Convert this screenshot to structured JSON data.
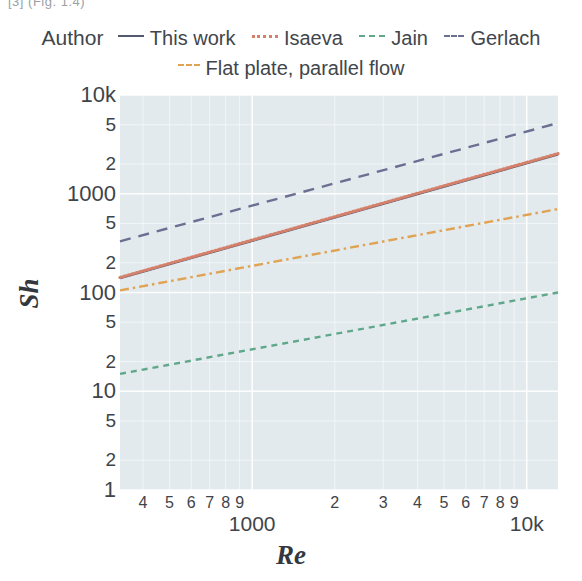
{
  "top_fragment": "[3] (Fig. 1.4)",
  "legend": {
    "title": "Author",
    "row1": [
      {
        "label": "This work",
        "style": "solid",
        "color": "#53586e"
      },
      {
        "label": "Isaeva",
        "style": "dotted",
        "color": "#d4806a"
      },
      {
        "label": "Jain",
        "style": "dashed-sm",
        "color": "#5fa88a"
      },
      {
        "label": "Gerlach",
        "style": "dashed-lg",
        "color": "#6b6f91"
      }
    ],
    "row2": [
      {
        "label": "Flat plate, parallel flow",
        "style": "dashdot",
        "color": "#e0a253"
      }
    ]
  },
  "chart_data": {
    "type": "line",
    "title": "",
    "xlabel": "Re",
    "ylabel": "Sh",
    "xscale": "log",
    "yscale": "log",
    "xlim": [
      330,
      13000
    ],
    "ylim": [
      1,
      10000
    ],
    "grid": true,
    "plot_bg": "#e3eaee",
    "legend_position": "top",
    "x_ticks_minor": [
      400,
      500,
      600,
      700,
      800,
      900,
      2000,
      3000,
      4000,
      5000,
      6000,
      7000,
      8000,
      9000
    ],
    "x_tick_labels_minor": [
      "4",
      "5",
      "6",
      "7",
      "8",
      "9",
      "2",
      "3",
      "4",
      "5",
      "6",
      "7",
      "8",
      "9"
    ],
    "x_ticks_major": [
      1000,
      10000
    ],
    "x_tick_labels_major": [
      "1000",
      "10k"
    ],
    "y_ticks": [
      1,
      2,
      5,
      10,
      20,
      50,
      100,
      200,
      500,
      1000,
      2000,
      5000,
      10000
    ],
    "y_tick_labels": [
      "1",
      "2",
      "5",
      "10",
      "5",
      "2",
      "100",
      "5",
      "2",
      "1000",
      "2",
      "5",
      "10k"
    ],
    "y_tick_labels_ordered_top_down": [
      "10k",
      "5",
      "2",
      "1000",
      "5",
      "2",
      "100",
      "5",
      "2",
      "10",
      "5",
      "2",
      "1"
    ],
    "series": [
      {
        "name": "This work",
        "style": "solid",
        "color": "#53586e",
        "points": [
          [
            330,
            140
          ],
          [
            13000,
            2500
          ]
        ],
        "slope_exponent": 0.785
      },
      {
        "name": "Isaeva",
        "style": "dotted",
        "color": "#d4806a",
        "points": [
          [
            330,
            142
          ],
          [
            13000,
            2550
          ]
        ],
        "slope_exponent": 0.785
      },
      {
        "name": "Jain",
        "style": "dashed",
        "color": "#5fa88a",
        "points": [
          [
            330,
            15
          ],
          [
            13000,
            100
          ]
        ],
        "slope_exponent": 0.515
      },
      {
        "name": "Gerlach",
        "style": "dashed-long",
        "color": "#6b6f91",
        "points": [
          [
            330,
            330
          ],
          [
            13000,
            5200
          ]
        ],
        "slope_exponent": 0.75
      },
      {
        "name": "Flat plate, parallel flow",
        "style": "dashdot",
        "color": "#e0a253",
        "points": [
          [
            330,
            105
          ],
          [
            13000,
            700
          ]
        ],
        "slope_exponent": 0.515
      }
    ]
  }
}
